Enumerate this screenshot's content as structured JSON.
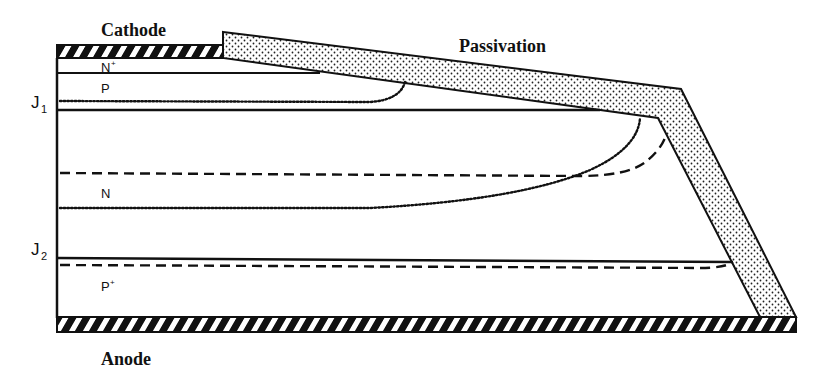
{
  "diagram": {
    "type": "thyristor cross-section with beveled edge passivation",
    "labels": {
      "cathode": "Cathode",
      "anode": "Anode",
      "passivation": "Passivation",
      "n_plus": "N",
      "n_plus_sup": "+",
      "p": "P",
      "n": "N",
      "p_plus": "P",
      "p_plus_sup": "+",
      "j1": "J",
      "j1_sub": "1",
      "j2": "J",
      "j2_sub": "2"
    },
    "layers": [
      {
        "name": "Cathode contact",
        "style": "hatched"
      },
      {
        "name": "N+",
        "region": "emitter"
      },
      {
        "name": "P",
        "region": "p-base"
      },
      {
        "name": "N",
        "region": "n-base"
      },
      {
        "name": "P+",
        "region": "anode emitter"
      },
      {
        "name": "Anode contact",
        "style": "hatched"
      }
    ],
    "junctions": [
      "J1",
      "J2"
    ],
    "line_styles": {
      "solid": "metallurgical junction",
      "dotted": "depletion boundary (J1)",
      "dashed": "depletion boundary (J2)"
    },
    "colors": {
      "ink": "#111111",
      "background": "#ffffff"
    }
  }
}
